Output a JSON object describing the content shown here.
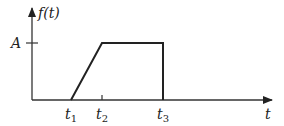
{
  "diagram": {
    "y_axis_label": "f(t)",
    "x_axis_label": "t",
    "amplitude_label": "A",
    "time_marks": [
      {
        "label": "t",
        "sub": "1"
      },
      {
        "label": "t",
        "sub": "2"
      },
      {
        "label": "t",
        "sub": "3"
      }
    ],
    "colors": {
      "line": "#222222",
      "axis": "#333333",
      "background": "#ffffff"
    }
  }
}
